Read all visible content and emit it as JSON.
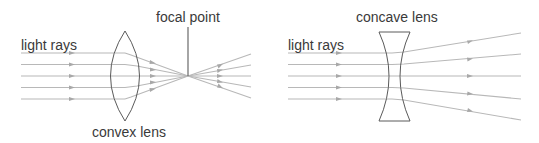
{
  "convex_panel": {
    "rays_label": "light rays",
    "focal_label": "focal point",
    "lens_label": "convex lens"
  },
  "concave_panel": {
    "rays_label": "light rays",
    "lens_label": "concave lens"
  },
  "colors": {
    "ray": "#b5b5b5",
    "lens": "#555555",
    "focal_line": "#666666",
    "text": "#3a3a3a"
  }
}
